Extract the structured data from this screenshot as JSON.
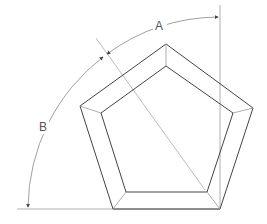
{
  "diagram": {
    "type": "angle-dimension-drawing",
    "labels": {
      "angle_a": "A",
      "angle_b": "B"
    },
    "colors": {
      "outline": "#444444",
      "dimension_line": "#888888",
      "bevel": "#999999"
    }
  }
}
